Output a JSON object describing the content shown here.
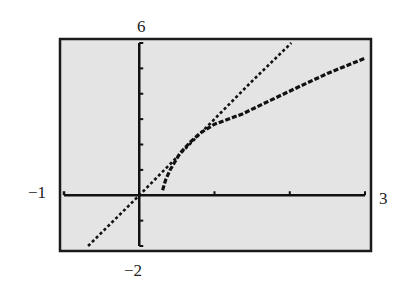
{
  "chart_data": {
    "type": "line",
    "title": "",
    "xlabel": "",
    "ylabel": "",
    "xlim": [
      -1,
      3
    ],
    "ylim": [
      -2,
      6
    ],
    "grid": false,
    "window_labels": {
      "xmin": "−1",
      "xmax": "3",
      "ymin": "−2",
      "ymax": "6"
    },
    "x_ticks": [
      0,
      1,
      2,
      3
    ],
    "y_ticks": [
      -2,
      -1,
      0,
      1,
      2,
      3,
      4,
      5,
      6
    ],
    "series": [
      {
        "name": "tangent-line",
        "style": "dotted",
        "x": [
          -0.68,
          0,
          0.5,
          1,
          1.5,
          2.02
        ],
        "y": [
          -2,
          0,
          1.5,
          3,
          4.5,
          6
        ]
      },
      {
        "name": "curve",
        "style": "dotted-thick",
        "x": [
          0.31,
          0.35,
          0.41,
          0.54,
          0.68,
          0.81,
          1.0,
          1.37,
          1.75,
          2.14,
          2.5,
          3.0
        ],
        "y": [
          0.2,
          0.6,
          1.0,
          1.65,
          2.1,
          2.45,
          2.8,
          3.2,
          3.75,
          4.3,
          4.8,
          5.4
        ]
      }
    ]
  },
  "colors": {
    "screen_bg": "#e4e4e4",
    "frame": "#1a1a1a",
    "axis": "#111111",
    "plot": "#111111"
  }
}
